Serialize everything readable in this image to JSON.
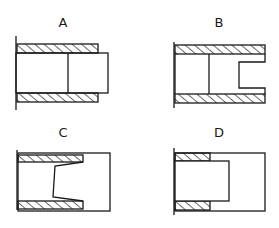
{
  "diagram": {
    "type": "technical cross-section drawings",
    "panels": [
      {
        "id": "A",
        "label": "A"
      },
      {
        "id": "B",
        "label": "B"
      },
      {
        "id": "C",
        "label": "C"
      },
      {
        "id": "D",
        "label": "D"
      }
    ],
    "colors": {
      "line": "#1a1a1a",
      "background": "#ffffff"
    }
  }
}
